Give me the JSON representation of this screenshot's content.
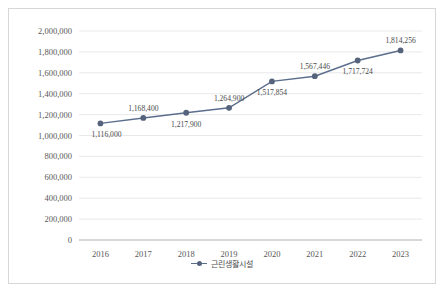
{
  "chart_data": {
    "type": "line",
    "title": "",
    "xlabel": "",
    "ylabel": "",
    "categories": [
      "2016",
      "2017",
      "2018",
      "2019",
      "2020",
      "2021",
      "2022",
      "2023"
    ],
    "series": [
      {
        "name": "근린생활시설",
        "color": "#5b6e8c",
        "values": [
          1116000,
          1168400,
          1217900,
          1264900,
          1517854,
          1567446,
          1717724,
          1814256
        ],
        "value_labels": [
          "1,116,000",
          "1,168,400",
          "1,217,900",
          "1,264,900",
          "1,517,854",
          "1,567,446",
          "1,717,724",
          "1,814,256"
        ],
        "label_positions": [
          "below",
          "above",
          "below",
          "above",
          "below",
          "above",
          "below",
          "above"
        ]
      }
    ],
    "ylim": [
      0,
      2000000
    ],
    "ytick_values": [
      0,
      200000,
      400000,
      600000,
      800000,
      1000000,
      1200000,
      1400000,
      1600000,
      1800000,
      2000000
    ],
    "ytick_labels": [
      "0",
      "200,000",
      "400,000",
      "600,000",
      "800,000",
      "1,000,000",
      "1,200,000",
      "1,400,000",
      "1,600,000",
      "1,800,000",
      "2,000,000"
    ],
    "grid": true,
    "legend_position": "bottom"
  },
  "legend": {
    "entries": [
      {
        "label": "근린생활시설"
      }
    ]
  }
}
